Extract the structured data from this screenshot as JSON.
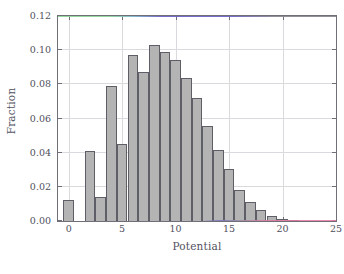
{
  "figure": {
    "background_color": "#ffffff",
    "frame_color": "#6f6f78",
    "grid_color": "#d9d9de",
    "bar_fill_color": "#b4b4b4",
    "bar_edge_color": "#5e5e66"
  },
  "caption": {
    "text": ""
  },
  "chart_data": {
    "type": "bar",
    "title": "",
    "subtitle": "",
    "xlabel": "Potential",
    "ylabel": "Fraction",
    "xlim": [
      -1,
      25
    ],
    "ylim": [
      0.0,
      0.12
    ],
    "xticks": [
      0,
      5,
      10,
      15,
      20,
      25
    ],
    "xticklabels": [
      "0",
      "5",
      "10",
      "15",
      "20",
      "25"
    ],
    "yticks": [
      0.0,
      0.02,
      0.04,
      0.06,
      0.08,
      0.1,
      0.12
    ],
    "yticklabels": [
      "0.00",
      "0.02",
      "0.04",
      "0.06",
      "0.08",
      "0.10",
      "0.12"
    ],
    "grid": true,
    "legend": null,
    "bin_width": 1,
    "categories": [
      0,
      1,
      2,
      3,
      4,
      5,
      6,
      7,
      8,
      9,
      10,
      11,
      12,
      13,
      14,
      15,
      16,
      17,
      18,
      19,
      20,
      21,
      22,
      23,
      24
    ],
    "values": [
      0.0125,
      0.0,
      0.041,
      0.0143,
      0.079,
      0.0452,
      0.0973,
      0.0873,
      0.1033,
      0.099,
      0.0945,
      0.0838,
      0.072,
      0.0557,
      0.0417,
      0.0305,
      0.0181,
      0.011,
      0.0063,
      0.0032,
      0.001,
      0.0003,
      0.0,
      0.0,
      0.0
    ],
    "annotations": []
  }
}
